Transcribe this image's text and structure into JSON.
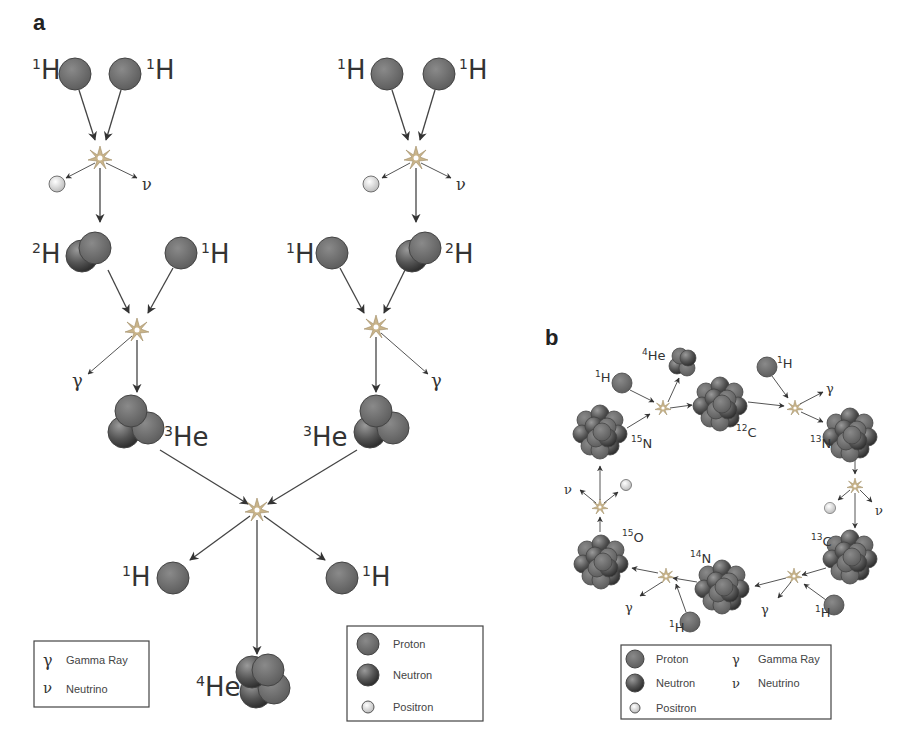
{
  "panel_a": {
    "label": "a",
    "nuclide_labels": {
      "h1": {
        "mass": "1",
        "symbol": "H"
      },
      "h2": {
        "mass": "2",
        "symbol": "H"
      },
      "he3": {
        "mass": "3",
        "symbol": "He"
      },
      "he4": {
        "mass": "4",
        "symbol": "He"
      }
    },
    "symbols": {
      "gamma": "γ",
      "neutrino": "ν"
    },
    "legend_left": {
      "items": [
        {
          "symbol": "γ",
          "label": "Gamma Ray"
        },
        {
          "symbol": "ν",
          "label": "Neutrino"
        }
      ]
    },
    "legend_right": {
      "items": [
        {
          "icon": "proton",
          "label": "Proton"
        },
        {
          "icon": "neutron",
          "label": "Neutron"
        },
        {
          "icon": "positron",
          "label": "Positron"
        }
      ]
    }
  },
  "panel_b": {
    "label": "b",
    "nuclide_labels": {
      "he4": {
        "mass": "4",
        "symbol": "He"
      },
      "h1": {
        "mass": "1",
        "symbol": "H"
      },
      "c12": {
        "mass": "12",
        "symbol": "C"
      },
      "n13": {
        "mass": "13",
        "symbol": "N"
      },
      "c13": {
        "mass": "13",
        "symbol": "C"
      },
      "n14": {
        "mass": "14",
        "symbol": "N"
      },
      "o15": {
        "mass": "15",
        "symbol": "O"
      },
      "n15": {
        "mass": "15",
        "symbol": "N"
      }
    },
    "symbols": {
      "gamma": "γ",
      "neutrino": "ν"
    },
    "legend": {
      "items": [
        {
          "icon": "proton",
          "label": "Proton"
        },
        {
          "icon": "neutron",
          "label": "Neutron"
        },
        {
          "icon": "positron",
          "label": "Positron"
        },
        {
          "symbol": "γ",
          "label": "Gamma Ray"
        },
        {
          "symbol": "ν",
          "label": "Neutrino"
        }
      ]
    }
  },
  "colors": {
    "proton": "#6f6f6f",
    "neutron": "#5a5a5a",
    "positron": "#f2f2f2",
    "burst": "#c9b48a"
  }
}
